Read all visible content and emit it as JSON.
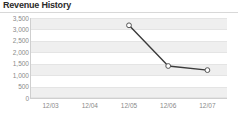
{
  "widget": {
    "title": "Revenue History"
  },
  "chart_data": {
    "type": "line",
    "title": "Revenue History",
    "xlabel": "",
    "ylabel": "",
    "categories": [
      "12/03",
      "12/04",
      "12/05",
      "12/06",
      "12/07"
    ],
    "x": [
      "12/03",
      "12/04",
      "12/05",
      "12/06",
      "12/07"
    ],
    "values": [
      null,
      null,
      3180,
      1400,
      1220
    ],
    "series": [
      {
        "name": "Revenue",
        "values": [
          null,
          null,
          3180,
          1400,
          1220
        ],
        "line_color": "#3b3b3b",
        "marker": "open-circle",
        "marker_fill": "#ffffff",
        "marker_stroke": "#555555"
      }
    ],
    "ylim": [
      0,
      3500
    ],
    "ytick_values": [
      3500,
      3000,
      2500,
      2000,
      1500,
      1000,
      500,
      0
    ],
    "ytick_labels": [
      "3,500",
      "3,000",
      "2,500",
      "2,000",
      "1,500",
      "1,000",
      "500",
      "0"
    ],
    "xtick_labels": [
      "12/03",
      "12/04",
      "12/05",
      "12/06",
      "12/07"
    ],
    "grid": true,
    "grid_style": "horizontal-banded",
    "band_color": "#efefef",
    "gridline_color": "#e4e4e4",
    "legend": false,
    "legend_position": "none",
    "axis_label_color": "#8a8a8a",
    "background": "#ffffff"
  }
}
